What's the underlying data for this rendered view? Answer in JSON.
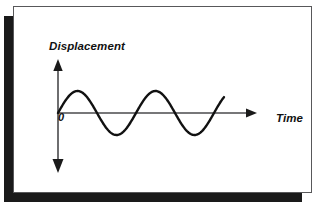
{
  "figure": {
    "name": "displacement-time-wave-diagram",
    "background_color": "#ffffff",
    "frame_border_color": "#58585a",
    "frame_shadow_color": "#1a1a1a"
  },
  "labels": {
    "y_axis": "Displacement",
    "x_axis": "Time",
    "origin": "0"
  },
  "chart_data": {
    "type": "line",
    "title": "",
    "xlabel": "Time",
    "ylabel": "Displacement",
    "grid": false,
    "legend": null,
    "annotations": [
      {
        "text": "Displacement",
        "role": "y-axis-label",
        "x": 35,
        "y": 33
      },
      {
        "text": "Time",
        "role": "x-axis-label",
        "x": 262,
        "y": 105
      },
      {
        "text": "0",
        "role": "origin-label",
        "x": 44,
        "y": 104
      }
    ],
    "axes": {
      "x_axis": {
        "origin_px": [
          57,
          112
        ],
        "end_px": [
          252,
          112
        ],
        "arrow": "single-right",
        "color": "#4a4a4c",
        "width_px": 1.6
      },
      "y_axis": {
        "top_px": [
          57,
          60
        ],
        "bottom_px": [
          57,
          170
        ],
        "arrow": "double-vertical",
        "color": "#4a4a4c",
        "width_px": 1.6
      }
    },
    "curve": {
      "shape": "sine",
      "color": "#111111",
      "stroke_width_px": 2.4,
      "amplitude_px": 22,
      "period_px": 78,
      "start_x_px": 57,
      "end_x_px": 223,
      "baseline_y_px": 112,
      "cycles": 2.13,
      "phase": "starts at zero rising",
      "series": [
        {
          "name": "displacement",
          "x": [
            0.0,
            0.13,
            0.25,
            0.38,
            0.5,
            0.63,
            0.75,
            0.88,
            1.0,
            1.13,
            1.25,
            1.38,
            1.5,
            1.63,
            1.75,
            1.88,
            2.0,
            2.13
          ],
          "values": [
            0.0,
            0.71,
            1.0,
            0.71,
            0.0,
            -0.71,
            -1.0,
            -0.71,
            0.0,
            0.71,
            1.0,
            0.71,
            0.0,
            -0.71,
            -1.0,
            -0.71,
            0.0,
            0.62
          ]
        }
      ],
      "xlim": [
        0,
        2.5
      ],
      "ylim": [
        -1.25,
        1.25
      ],
      "x_unit": "periods",
      "y_unit": "normalized amplitude"
    }
  }
}
